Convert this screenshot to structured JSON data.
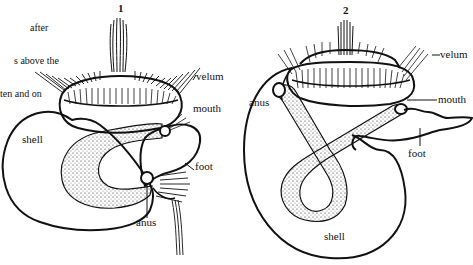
{
  "caption": {
    "lines": [
      "after",
      "s above the",
      "ten and on"
    ]
  },
  "figure1": {
    "number": "1",
    "labels": {
      "velum": "velum",
      "mouth": "mouth",
      "shell": "shell",
      "foot": "foot",
      "anus": "anus"
    }
  },
  "figure2": {
    "number": "2",
    "labels": {
      "velum": "velum",
      "mouth": "mouth",
      "anus": "anus",
      "foot": "foot",
      "shell": "shell"
    }
  },
  "colors": {
    "line": "#111111",
    "background": "#ffffff"
  }
}
